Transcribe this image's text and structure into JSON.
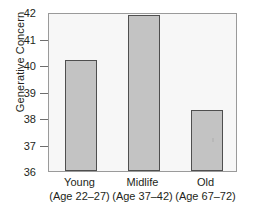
{
  "chart_data": {
    "type": "bar",
    "title": "",
    "subtitle": "",
    "xlabel": "",
    "ylabel": "Generative Concern",
    "categories": [
      "Young",
      "Midlife",
      "Old"
    ],
    "category_sublabels": [
      "(Age 22–27)",
      "(Age 37–42)",
      "(Age 67–72)"
    ],
    "values": [
      40.2,
      41.9,
      38.3
    ],
    "ylim": [
      36,
      42
    ],
    "yticks": [
      36,
      37,
      38,
      39,
      40,
      41,
      42
    ],
    "ytick_labels": [
      "36",
      "37",
      "38",
      "39",
      "40",
      "41",
      "42"
    ],
    "grid": false,
    "legend": null,
    "bar_color": "#c3c3c3",
    "bar_edge_color": "#4f4f4f",
    "plot_background": "#f7f7f7",
    "axis_color": "#9a9a9a",
    "text_color": "#231f20",
    "annotations": []
  }
}
